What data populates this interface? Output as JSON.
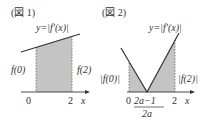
{
  "figure1": {
    "title": "(図 1)",
    "curve_label": "y=|f′(x)|",
    "left_label": "f(0)",
    "right_label": "f(2)",
    "x_tick_0": "0",
    "x_tick_2": "2",
    "x_axis": "x"
  },
  "figure2": {
    "title": "(図 2)",
    "curve_label": "y=|f′(x)|",
    "left_label": "|f(0)|",
    "right_label": "|f(2)|",
    "x_tick_0": "0",
    "x_tick_mid": "2a−1",
    "x_tick_2": "2",
    "x_axis": "x",
    "below_label": "2a"
  },
  "colors": {
    "shade": "#c4c4c4",
    "line": "#333333"
  }
}
